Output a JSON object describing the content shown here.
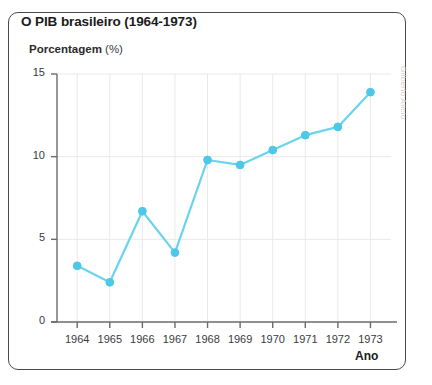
{
  "card": {
    "title": "O PIB brasileiro (1964-1973)",
    "credit": "Gilberto Alicio"
  },
  "axis": {
    "y_label_strong": "Porcentagem",
    "y_label_unit": "(%)",
    "x_label": "Ano"
  },
  "colors": {
    "line": "#6ad4ef",
    "marker": "#4ec8e8",
    "grid": "#e9e9e9",
    "axis": "#6b6b6b",
    "border": "#4a4a4a",
    "title_text": "#1b1b1b",
    "credit_text": "#cfcfcf"
  },
  "chart_data": {
    "type": "line",
    "title": "O PIB brasileiro (1964-1973)",
    "xlabel": "Ano",
    "ylabel": "Porcentagem (%)",
    "categories": [
      "1964",
      "1965",
      "1966",
      "1967",
      "1968",
      "1969",
      "1970",
      "1971",
      "1972",
      "1973"
    ],
    "values": [
      3.4,
      2.4,
      6.7,
      4.2,
      9.8,
      9.5,
      10.4,
      11.3,
      11.8,
      13.9
    ],
    "x": [
      1964,
      1965,
      1966,
      1967,
      1968,
      1969,
      1970,
      1971,
      1972,
      1973
    ],
    "ylim": [
      0,
      15
    ],
    "yticks": [
      0,
      5,
      10,
      15
    ],
    "ytick_labels": [
      "0",
      "5",
      "10",
      "15"
    ],
    "xtick_labels": [
      "1964",
      "1965",
      "1966",
      "1967",
      "1968",
      "1969",
      "1970",
      "1971",
      "1972",
      "1973"
    ],
    "grid": true,
    "grid_axis": "both",
    "legend": false,
    "marker": "circle",
    "series": [
      {
        "name": "PIB",
        "values": [
          3.4,
          2.4,
          6.7,
          4.2,
          9.8,
          9.5,
          10.4,
          11.3,
          11.8,
          13.9
        ]
      }
    ]
  }
}
